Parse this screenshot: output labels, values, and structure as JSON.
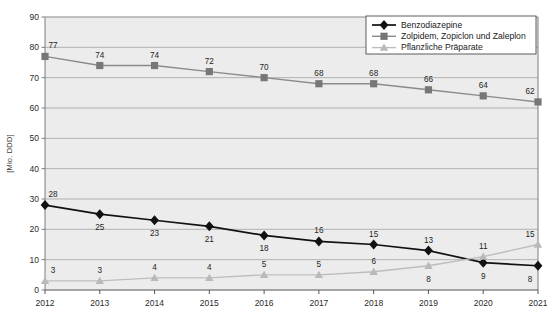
{
  "chart_data": {
    "type": "line",
    "title": "",
    "xlabel": "",
    "ylabel": "[Mio. DDD]",
    "x": [
      "2012",
      "2013",
      "2014",
      "2015",
      "2016",
      "2017",
      "2018",
      "2019",
      "2020",
      "2021"
    ],
    "categories": [
      "2012",
      "2013",
      "2014",
      "2015",
      "2016",
      "2017",
      "2018",
      "2019",
      "2020",
      "2021"
    ],
    "ylim": [
      0,
      90
    ],
    "yticks": [
      0,
      10,
      20,
      30,
      40,
      50,
      60,
      70,
      80,
      90
    ],
    "grid": true,
    "legend_position": "top-right",
    "series": [
      {
        "name": "Benzodiazepine",
        "marker": "diamond",
        "color": "#111111",
        "line_color": "#111111",
        "values": [
          28,
          25,
          23,
          21,
          18,
          16,
          15,
          13,
          9,
          8
        ],
        "label_positions": [
          "above",
          "below",
          "below",
          "below",
          "below",
          "above",
          "above",
          "above",
          "below",
          "below"
        ]
      },
      {
        "name": "Zolpidem, Zopiclon und Zaleplon",
        "marker": "square",
        "color": "#777777",
        "line_color": "#8a8a8a",
        "values": [
          77,
          74,
          74,
          72,
          70,
          68,
          68,
          66,
          64,
          62
        ],
        "label_positions": [
          "above",
          "above",
          "above",
          "above",
          "above",
          "above",
          "above",
          "above",
          "above",
          "above"
        ]
      },
      {
        "name": "Pflanzliche Präparate",
        "marker": "triangle",
        "color": "#b9b9b9",
        "line_color": "#bdbdbd",
        "values": [
          3,
          3,
          4,
          4,
          5,
          5,
          6,
          8,
          11,
          15
        ],
        "label_positions": [
          "above",
          "above",
          "above",
          "above",
          "above",
          "above",
          "above",
          "below",
          "above",
          "above"
        ]
      }
    ]
  },
  "legend": {
    "entries": [
      {
        "label": "Benzodiazepine"
      },
      {
        "label": "Zolpidem, Zopiclon und Zaleplon"
      },
      {
        "label": "Pflanzliche Präparate"
      }
    ]
  },
  "axes": {
    "y_title": "[Mio. DDD]",
    "y_tick_labels": [
      "90",
      "80",
      "70",
      "60",
      "50",
      "40",
      "30",
      "20",
      "10",
      "0"
    ],
    "x_tick_labels": [
      "2012",
      "2013",
      "2014",
      "2015",
      "2016",
      "2017",
      "2018",
      "2019",
      "2020",
      "2021"
    ]
  },
  "colors": {
    "plot_background": "#ececec",
    "grid_line": "#9a9a9a",
    "axis_line": "#7d7d7d",
    "page_background": "#ffffff",
    "series_benzodiazepine": "#111111",
    "series_zolpidem": "#7d7d7d",
    "series_pflanzliche": "#bcbcbc"
  }
}
